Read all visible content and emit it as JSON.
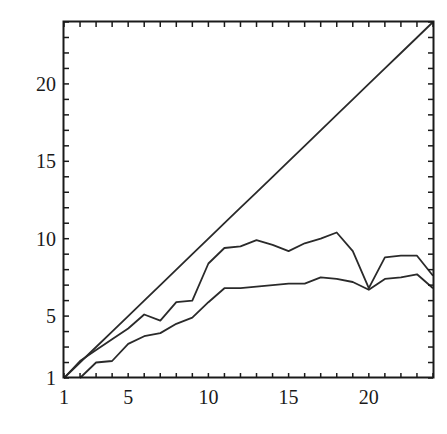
{
  "chart_data": {
    "type": "line",
    "title": "",
    "xlabel": "",
    "ylabel": "",
    "xlim": [
      1,
      24
    ],
    "ylim": [
      1,
      24
    ],
    "grid": false,
    "legend": null,
    "x_ticks": [
      1,
      5,
      10,
      15,
      20
    ],
    "y_ticks": [
      1,
      5,
      10,
      15,
      20
    ],
    "x_minor_step": 1,
    "y_minor_step": 1,
    "x": [
      1,
      2,
      3,
      4,
      5,
      6,
      7,
      8,
      9,
      10,
      11,
      12,
      13,
      14,
      15,
      16,
      17,
      18,
      19,
      20,
      21,
      22,
      23,
      24
    ],
    "series": [
      {
        "name": "diagonal",
        "values": [
          1,
          2,
          3,
          4,
          5,
          6,
          7,
          8,
          9,
          10,
          11,
          12,
          13,
          14,
          15,
          16,
          17,
          18,
          19,
          20,
          21,
          22,
          23,
          24
        ]
      },
      {
        "name": "upper",
        "values": [
          1,
          2.1,
          2.8,
          3.5,
          4.2,
          5.1,
          4.7,
          5.9,
          6.0,
          8.4,
          9.4,
          9.5,
          9.9,
          9.6,
          9.2,
          9.7,
          10.0,
          10.4,
          9.2,
          6.8,
          8.8,
          8.9,
          8.9,
          7.6
        ]
      },
      {
        "name": "lower",
        "values": [
          0.6,
          1.0,
          2.0,
          2.1,
          3.2,
          3.7,
          3.9,
          4.5,
          4.9,
          5.9,
          6.8,
          6.8,
          6.9,
          7.0,
          7.1,
          7.1,
          7.5,
          7.4,
          7.2,
          6.7,
          7.4,
          7.5,
          7.7,
          6.8
        ]
      }
    ]
  },
  "colors": {
    "line": "#2a2a2a",
    "axis": "#1a1a1a",
    "background": "#ffffff"
  }
}
